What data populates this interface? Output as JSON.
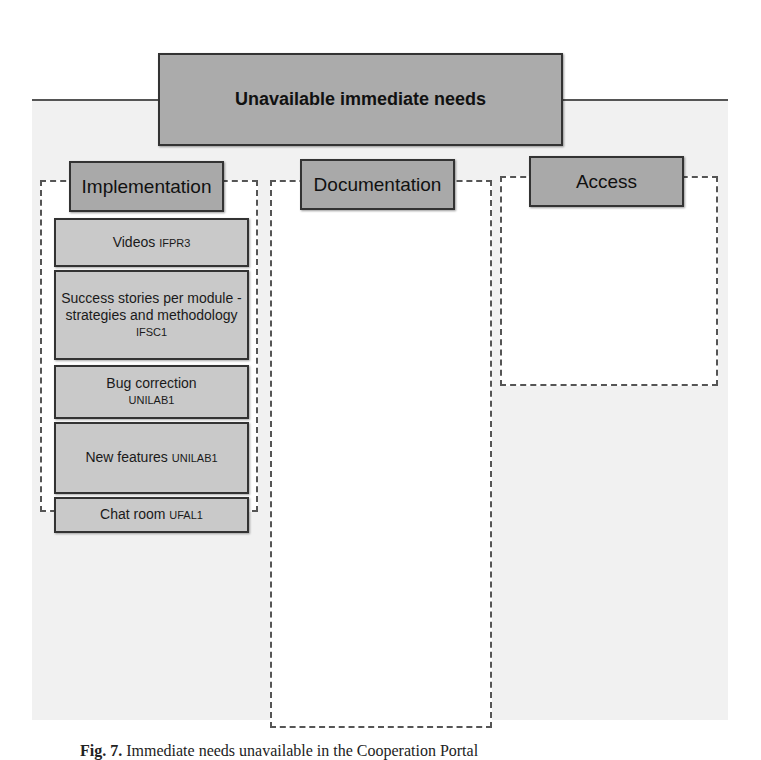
{
  "title": "Unavailable immediate needs",
  "groups": {
    "implementation": {
      "header": "Implementation",
      "items": [
        {
          "text": "Videos",
          "code": "IFPR3"
        },
        {
          "text": "Success stories per module - strategies and methodology",
          "code": "IFSC1"
        },
        {
          "text": "Bug correction",
          "code": "UNILAB1"
        },
        {
          "text": "New features",
          "code": "UNILAB1"
        },
        {
          "text": "Chat room",
          "code": "UFAL1"
        },
        {
          "text": "Perform code merge",
          "code": "UNILAB1"
        }
      ]
    },
    "documentation": {
      "header": "Documentation",
      "items": [
        {
          "text": "Guides and configuration, parametrization and installation tutorials",
          "code": "UNILAB1,CADEA"
        },
        {
          "text": "Articles on the technologies used",
          "code": "UNILAB1"
        },
        {
          "text": "Cooperation Wiki built collaboratively",
          "code": "IFC1"
        },
        {
          "text": "Architecture manuals and videos",
          "code": "UFRA1"
        },
        {
          "text": "IFES implementation's schedule and systems' business documentation",
          "code": "UFGD1"
        },
        {
          "text": "Difficulties and solutions of the problems found by other institutions",
          "code": "UFSB1, CGUA,MJA"
        }
      ]
    },
    "access": {
      "header": "Access",
      "items": [
        {
          "text": "Access to the portal",
          "code": "PRFA,UFS2"
        },
        {
          "text": "Video conferences recording",
          "code": "PRFA"
        },
        {
          "text": "Information from multiple institutions, not only UFRN",
          "code": "UFS2"
        },
        {
          "text": "Larger use by the partners",
          "code": "ABINA"
        }
      ]
    },
    "no_suggestions": {
      "text": "No suggestions",
      "code": "INSSA, UFRR1, UFPE3, UFG3, UNIFEI1, ABINA"
    }
  },
  "caption": {
    "label": "Fig. 7.",
    "text": "Immediate needs unavailable in the Cooperation Portal"
  }
}
